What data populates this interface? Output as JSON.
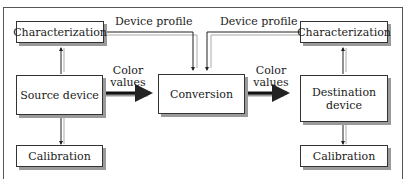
{
  "diagram": {
    "nodes": {
      "char_left": "Characterization",
      "source": "Source device",
      "cal_left": "Calibration",
      "conversion": "Conversion",
      "char_right": "Characterization",
      "destination_line1": "Destination",
      "destination_line2": "device",
      "cal_right": "Calibration"
    },
    "edge_labels": {
      "profile_left": "Device profile",
      "profile_right": "Device profile",
      "color_left_1": "Color",
      "color_left_2": "values",
      "color_right_1": "Color",
      "color_right_2": "values"
    },
    "colors": {
      "line": "#222222",
      "shadow": "#9a9a9a",
      "frame": "#555555"
    }
  }
}
